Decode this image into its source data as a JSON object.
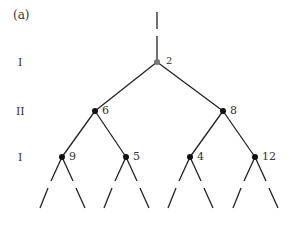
{
  "panel_label": "(a)",
  "levels": [
    {
      "label": "I",
      "y": 62
    },
    {
      "label": "II",
      "y": 111
    },
    {
      "label": "I",
      "y": 157
    }
  ],
  "nodes": [
    {
      "id": "root",
      "value": "2",
      "x": 157,
      "y": 62,
      "color": "#777777"
    },
    {
      "id": "l",
      "value": "6",
      "x": 95,
      "y": 111,
      "color": "#111111"
    },
    {
      "id": "r",
      "value": "8",
      "x": 223,
      "y": 111,
      "color": "#111111"
    },
    {
      "id": "ll",
      "value": "9",
      "x": 62,
      "y": 157,
      "color": "#111111"
    },
    {
      "id": "lr",
      "value": "5",
      "x": 126,
      "y": 157,
      "color": "#111111"
    },
    {
      "id": "rl",
      "value": "4",
      "x": 190,
      "y": 157,
      "color": "#111111"
    },
    {
      "id": "rr",
      "value": "12",
      "x": 255,
      "y": 157,
      "color": "#111111"
    }
  ],
  "colors": {
    "line": "#222222",
    "text": "#333333"
  }
}
